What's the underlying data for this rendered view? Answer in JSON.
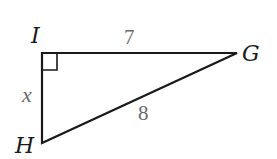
{
  "diagram": {
    "type": "right-triangle",
    "vertices": [
      {
        "name": "I",
        "x": 42,
        "y": 53,
        "right_angle": true
      },
      {
        "name": "G",
        "x": 237,
        "y": 53
      },
      {
        "name": "H",
        "x": 42,
        "y": 143
      }
    ],
    "sides": [
      {
        "segment": "IG",
        "label": "7"
      },
      {
        "segment": "IH",
        "label": "x"
      },
      {
        "segment": "HG",
        "label": "8"
      }
    ],
    "colors": {
      "lines": "#1a1a1a",
      "side_labels": "#6b6b6b",
      "background": "#ffffff"
    }
  },
  "labels": {
    "vertex_i": "I",
    "vertex_g": "G",
    "vertex_h": "H",
    "side_ig": "7",
    "side_ih": "x",
    "side_hg": "8"
  }
}
